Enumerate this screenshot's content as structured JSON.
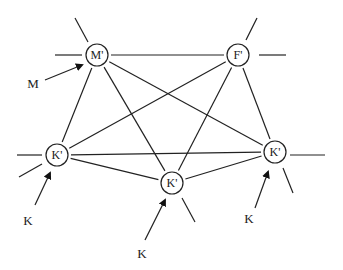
{
  "diagram": {
    "nodes": [
      {
        "id": "M",
        "label": "M'"
      },
      {
        "id": "F",
        "label": "F'"
      },
      {
        "id": "KL",
        "label": "K'"
      },
      {
        "id": "KC",
        "label": "K'"
      },
      {
        "id": "KR",
        "label": "K'"
      }
    ],
    "edges": [
      [
        "M",
        "F"
      ],
      [
        "M",
        "KL"
      ],
      [
        "M",
        "KC"
      ],
      [
        "M",
        "KR"
      ],
      [
        "F",
        "KL"
      ],
      [
        "F",
        "KC"
      ],
      [
        "F",
        "KR"
      ],
      [
        "KL",
        "KR"
      ],
      [
        "KL",
        "KC"
      ],
      [
        "KC",
        "KR"
      ]
    ],
    "pointer_labels": [
      {
        "target": "M",
        "text": "M"
      },
      {
        "target": "KL",
        "text": "K"
      },
      {
        "target": "KC",
        "text": "K"
      },
      {
        "target": "KR",
        "text": "K"
      }
    ]
  }
}
